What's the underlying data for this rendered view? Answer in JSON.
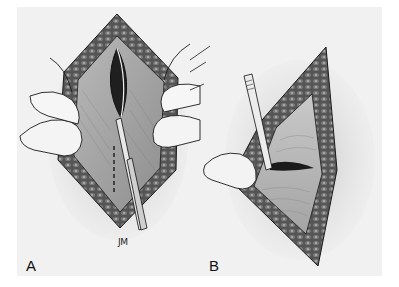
{
  "figure": {
    "panels": [
      {
        "id": "A",
        "label": "A",
        "description": "Incision held open by fingers; scalpel making dashed-line cut through fascia"
      },
      {
        "id": "B",
        "label": "B",
        "description": "Triangular wound opening with scalpel inserted under fascial layer; finger retracting"
      }
    ],
    "signature": "JM",
    "colors": {
      "background": "#ffffff",
      "frame": "#f1f1f1",
      "ink": "#1a1a1a",
      "tissue": "#8a8a8a",
      "muscle": "#5c5c5c"
    }
  }
}
